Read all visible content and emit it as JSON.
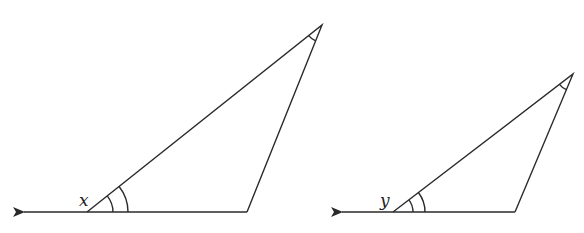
{
  "diagram": {
    "stroke_color": "#2a2a2a",
    "triangles": [
      {
        "exterior_angle_label": "x",
        "vertices": {
          "left": [
            87,
            212
          ],
          "right": [
            247,
            212
          ],
          "top": [
            322,
            25
          ]
        },
        "ray_tip": [
          22,
          212
        ],
        "angle_marks": {
          "at_left": "double arc",
          "at_top": "single arc"
        }
      },
      {
        "exterior_angle_label": "y",
        "vertices": {
          "left": [
            393,
            212
          ],
          "right": [
            515,
            212
          ],
          "top": [
            573,
            74
          ]
        },
        "ray_tip": [
          340,
          212
        ],
        "angle_marks": {
          "at_left": "double arc",
          "at_top": "single arc"
        }
      }
    ]
  }
}
